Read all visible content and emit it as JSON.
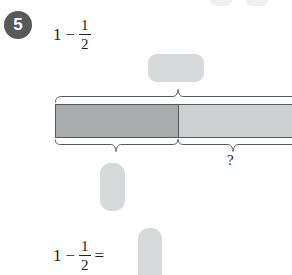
{
  "worksheet": {
    "question_number": "5",
    "top_expression": {
      "first_term": "1",
      "operator": "−",
      "fraction": {
        "numerator": "1",
        "denominator": "2"
      }
    },
    "bottom_expression": {
      "first_term": "1",
      "operator": "−",
      "fraction": {
        "numerator": "1",
        "denominator": "2"
      },
      "equals": "=",
      "answer": ""
    },
    "blanks": {
      "top_label": "",
      "left_label": "",
      "answer_label": ""
    },
    "bar_model": {
      "whole_brace_label": "",
      "shaded_brace_label": "",
      "unknown_brace_label": "?",
      "shaded_fraction": "1/2",
      "unshaded_fraction": "1/2",
      "shaded_color": "#aaabad",
      "unshaded_color": "#cdcfd0",
      "outline_color": "#58595b"
    },
    "colors": {
      "badge_background": "#58595b",
      "badge_text": "#ffffff",
      "blank_fill": "#d7d8d9",
      "text": "#231f20"
    }
  }
}
